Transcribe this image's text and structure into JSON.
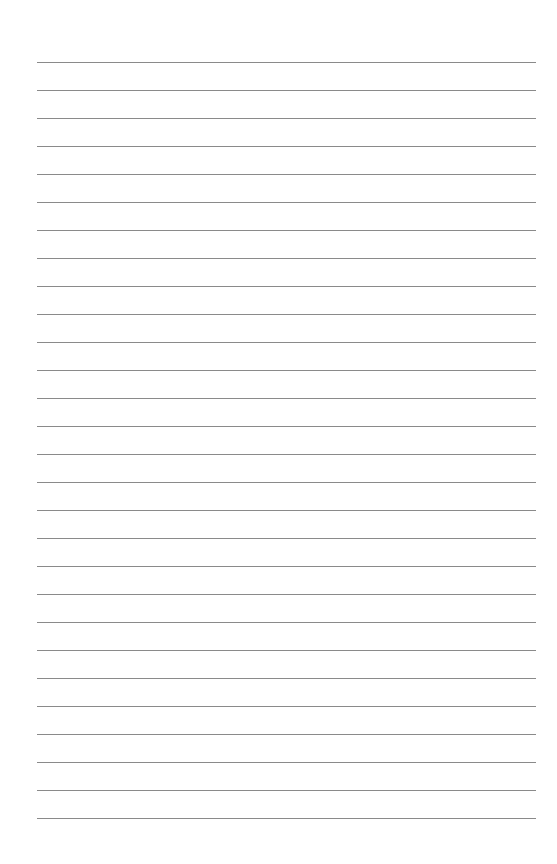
{
  "page": {
    "type": "lined-paper",
    "background_color": "#ffffff",
    "line_color": "#8a8a8a",
    "line_count": 28,
    "first_line_y": 62,
    "line_spacing": 28,
    "line_left": 37,
    "line_right": 536
  }
}
